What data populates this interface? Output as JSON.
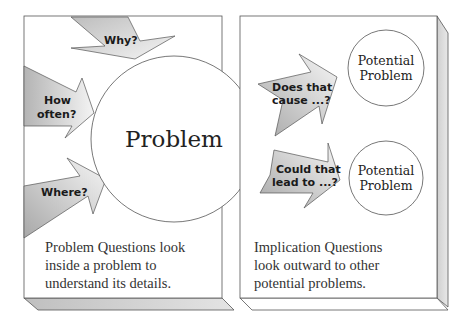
{
  "left_panel": {
    "center_circle": {
      "label": "Problem"
    },
    "arrows": [
      {
        "id": "why",
        "label_lines": [
          "Why?"
        ]
      },
      {
        "id": "how-often",
        "label_lines": [
          "How",
          "often?"
        ]
      },
      {
        "id": "where",
        "label_lines": [
          "Where?"
        ]
      }
    ],
    "caption_lines": [
      "Problem Questions look",
      "inside a problem to",
      "understand its details."
    ]
  },
  "right_panel": {
    "circles": [
      {
        "label_lines": [
          "Potential",
          "Problem"
        ]
      },
      {
        "label_lines": [
          "Potential",
          "Problem"
        ]
      }
    ],
    "arrows": [
      {
        "id": "does-that-cause",
        "label_lines": [
          "Does that",
          "cause ...?"
        ]
      },
      {
        "id": "could-that-lead",
        "label_lines": [
          "Could that",
          "lead to ...?"
        ]
      }
    ],
    "caption_lines": [
      "Implication Questions",
      "look outward to other",
      "potential problems."
    ]
  },
  "colors": {
    "stroke": "#555555",
    "panel_side": "#d8d8d8",
    "arrow_light": "#f2f2f2",
    "arrow_dark": "#b8b8b8",
    "text": "#222222"
  }
}
